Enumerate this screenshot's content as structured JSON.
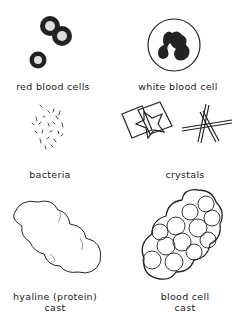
{
  "figure": {
    "panels": [
      {
        "id": "rbc",
        "label": "red blood cells",
        "icon": "red-blood-cells-icon"
      },
      {
        "id": "wbc",
        "label": "white blood cell",
        "icon": "white-blood-cell-icon"
      },
      {
        "id": "bacteria",
        "label": "bacteria",
        "icon": "bacteria-icon"
      },
      {
        "id": "crystals",
        "label": "crystals",
        "icon": "crystals-icon"
      },
      {
        "id": "hyaline",
        "label_line1": "hyaline (protein)",
        "label_line2": "cast",
        "icon": "hyaline-cast-icon"
      },
      {
        "id": "bloodcast",
        "label_line1": "blood cell",
        "label_line2": "cast",
        "icon": "blood-cell-cast-icon"
      }
    ]
  }
}
